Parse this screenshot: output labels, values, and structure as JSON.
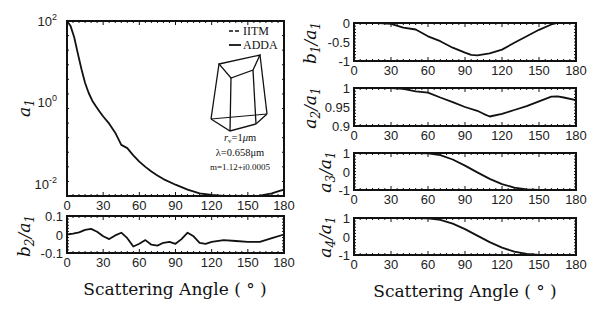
{
  "figure": {
    "xlabel": "Scattering Angle ( ° )",
    "legend": [
      {
        "label": "IITM",
        "style": "dashed"
      },
      {
        "label": "ADDA",
        "style": "solid"
      }
    ],
    "annotation": {
      "line1": "r_v=1μm",
      "line2": "λ=0.658μm",
      "line3": "m=1.12+i0.0005"
    }
  },
  "chart_data": [
    {
      "id": "a1",
      "type": "line",
      "ylabel": "a1",
      "yscale": "log",
      "xlim": [
        0,
        180
      ],
      "ylim": [
        0.005,
        100
      ],
      "xticks": [
        0,
        30,
        60,
        90,
        120,
        150,
        180
      ],
      "yticks": [
        {
          "v": 100,
          "label": "10^2"
        },
        {
          "v": 1,
          "label": "10^0"
        },
        {
          "v": 0.01,
          "label": "10^-2"
        }
      ],
      "series": [
        {
          "name": "ADDA",
          "x": [
            0,
            3,
            6,
            9,
            12,
            15,
            18,
            21,
            24,
            27,
            30,
            35,
            40,
            45,
            50,
            55,
            60,
            65,
            70,
            75,
            80,
            90,
            100,
            110,
            120,
            130,
            140,
            150,
            160,
            170,
            175,
            180
          ],
          "y": [
            100,
            75,
            40,
            16,
            6.5,
            3.0,
            1.7,
            1.1,
            0.8,
            0.6,
            0.45,
            0.3,
            0.18,
            0.09,
            0.075,
            0.05,
            0.035,
            0.026,
            0.02,
            0.016,
            0.013,
            0.0095,
            0.0072,
            0.0058,
            0.0053,
            0.005,
            0.0048,
            0.0048,
            0.0051,
            0.0058,
            0.0065,
            0.0072
          ]
        },
        {
          "name": "IITM",
          "x": [],
          "y": []
        }
      ],
      "grid": false
    },
    {
      "id": "b2a1",
      "type": "line",
      "ylabel": "b2/a1",
      "xlim": [
        0,
        180
      ],
      "ylim": [
        -0.1,
        0.1
      ],
      "xticks": [
        0,
        30,
        60,
        90,
        120,
        150,
        180
      ],
      "yticks": [
        {
          "v": 0.1,
          "label": "0.1"
        },
        {
          "v": 0,
          "label": "0"
        },
        {
          "v": -0.1,
          "label": "-0.1"
        }
      ],
      "series": [
        {
          "name": "ADDA",
          "x": [
            0,
            5,
            10,
            15,
            20,
            25,
            30,
            35,
            40,
            45,
            50,
            55,
            60,
            65,
            70,
            75,
            80,
            85,
            90,
            95,
            100,
            105,
            110,
            115,
            120,
            130,
            140,
            150,
            160,
            170,
            180
          ],
          "y": [
            0.0,
            0.005,
            0.012,
            0.025,
            0.03,
            0.015,
            -0.01,
            -0.025,
            -0.005,
            0.01,
            -0.02,
            -0.065,
            -0.05,
            -0.03,
            -0.055,
            -0.06,
            -0.045,
            -0.04,
            -0.05,
            -0.025,
            0.01,
            -0.01,
            -0.045,
            -0.05,
            -0.04,
            -0.03,
            -0.035,
            -0.04,
            -0.04,
            -0.02,
            0.0
          ]
        }
      ],
      "grid": false
    },
    {
      "id": "b1a1",
      "type": "line",
      "ylabel": "b1/a1",
      "xlim": [
        0,
        180
      ],
      "ylim": [
        -1,
        0
      ],
      "xticks": [
        0,
        30,
        60,
        90,
        120,
        150,
        180
      ],
      "yticks": [
        {
          "v": 0,
          "label": "0"
        },
        {
          "v": -0.5,
          "label": "-0.5"
        },
        {
          "v": -1,
          "label": "-1"
        }
      ],
      "series": [
        {
          "name": "ADDA",
          "x": [
            0,
            20,
            30,
            40,
            50,
            60,
            70,
            80,
            90,
            95,
            100,
            110,
            120,
            130,
            140,
            150,
            160,
            165,
            170,
            180
          ],
          "y": [
            0,
            0,
            -0.02,
            -0.12,
            -0.17,
            -0.35,
            -0.48,
            -0.65,
            -0.78,
            -0.84,
            -0.85,
            -0.8,
            -0.7,
            -0.52,
            -0.35,
            -0.18,
            -0.04,
            0,
            0,
            0
          ]
        }
      ],
      "grid": false
    },
    {
      "id": "a2a1",
      "type": "line",
      "ylabel": "a2/a1",
      "xlim": [
        0,
        180
      ],
      "ylim": [
        0.9,
        1
      ],
      "xticks": [
        0,
        30,
        60,
        90,
        120,
        150,
        180
      ],
      "yticks": [
        {
          "v": 1,
          "label": "1"
        },
        {
          "v": 0.95,
          "label": "0.95"
        },
        {
          "v": 0.9,
          "label": "0.9"
        }
      ],
      "series": [
        {
          "name": "ADDA",
          "x": [
            0,
            20,
            30,
            40,
            50,
            60,
            70,
            80,
            90,
            100,
            105,
            110,
            120,
            130,
            140,
            150,
            160,
            165,
            170,
            180
          ],
          "y": [
            1,
            1,
            1,
            0.998,
            0.991,
            0.988,
            0.975,
            0.963,
            0.95,
            0.94,
            0.932,
            0.925,
            0.932,
            0.942,
            0.952,
            0.965,
            0.977,
            0.978,
            0.975,
            0.968
          ]
        }
      ],
      "grid": false
    },
    {
      "id": "a3a1",
      "type": "line",
      "ylabel": "a3/a1",
      "xlim": [
        0,
        180
      ],
      "ylim": [
        -1,
        1
      ],
      "xticks": [
        0,
        30,
        60,
        90,
        120,
        150,
        180
      ],
      "yticks": [
        {
          "v": 1,
          "label": "1"
        },
        {
          "v": 0,
          "label": "0"
        },
        {
          "v": -1,
          "label": "-1"
        }
      ],
      "series": [
        {
          "name": "ADDA",
          "x": [
            0,
            30,
            50,
            60,
            70,
            80,
            90,
            100,
            110,
            120,
            130,
            140,
            150,
            160,
            170,
            180
          ],
          "y": [
            1,
            1,
            1,
            0.98,
            0.88,
            0.65,
            0.32,
            -0.05,
            -0.4,
            -0.68,
            -0.87,
            -0.96,
            -0.99,
            -1,
            -1,
            -1
          ]
        }
      ],
      "grid": false
    },
    {
      "id": "a4a1",
      "type": "line",
      "ylabel": "a4/a1",
      "xlim": [
        0,
        180
      ],
      "ylim": [
        -1,
        1
      ],
      "xticks": [
        0,
        30,
        60,
        90,
        120,
        150,
        180
      ],
      "yticks": [
        {
          "v": 1,
          "label": "1"
        },
        {
          "v": 0,
          "label": "0"
        },
        {
          "v": -1,
          "label": "-1"
        }
      ],
      "series": [
        {
          "name": "ADDA",
          "x": [
            0,
            30,
            50,
            60,
            70,
            80,
            90,
            100,
            110,
            120,
            130,
            140,
            150,
            160,
            170,
            180
          ],
          "y": [
            1,
            1,
            1,
            0.98,
            0.9,
            0.7,
            0.4,
            0.05,
            -0.3,
            -0.6,
            -0.82,
            -0.94,
            -0.99,
            -1,
            -1,
            -1
          ]
        }
      ],
      "grid": false
    }
  ],
  "layout": {
    "panels": {
      "a1": {
        "x": 67,
        "y": 21,
        "w": 217,
        "h": 175
      },
      "b2a1": {
        "x": 67,
        "y": 216,
        "w": 217,
        "h": 37
      },
      "b1a1": {
        "x": 354,
        "y": 23,
        "w": 222,
        "h": 38
      },
      "a2a1": {
        "x": 354,
        "y": 88,
        "w": 222,
        "h": 38
      },
      "a3a1": {
        "x": 354,
        "y": 153,
        "w": 222,
        "h": 37
      },
      "a4a1": {
        "x": 354,
        "y": 218,
        "w": 222,
        "h": 37
      }
    }
  }
}
